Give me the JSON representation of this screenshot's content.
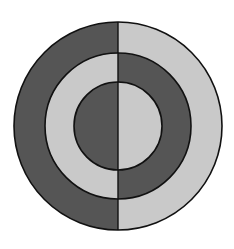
{
  "diagram": {
    "type": "concentric-split-circles",
    "center": [
      118,
      126
    ],
    "rings": [
      {
        "name": "outer",
        "radius": 104,
        "left_fill": "#555555",
        "right_fill": "#c9c9c9"
      },
      {
        "name": "middle",
        "radius": 73,
        "left_fill": "#c9c9c9",
        "right_fill": "#555555"
      },
      {
        "name": "inner",
        "radius": 44,
        "left_fill": "#555555",
        "right_fill": "#c9c9c9"
      }
    ],
    "colors": {
      "dark": "#555555",
      "light": "#c9c9c9",
      "stroke": "#111111",
      "background": "#ffffff"
    }
  }
}
